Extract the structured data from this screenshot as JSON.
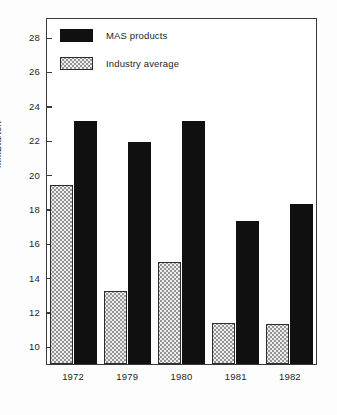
{
  "chart_data": {
    "type": "bar",
    "title": "",
    "subtitle": "",
    "xlabel": "",
    "ylabel": "MMBtu/ton",
    "categories": [
      "1972",
      "1979",
      "1980",
      "1981",
      "1982"
    ],
    "series": [
      {
        "name": "MAS products",
        "values": [
          23.2,
          22.0,
          23.2,
          17.4,
          18.4
        ]
      },
      {
        "name": "Industry average",
        "values": [
          19.45,
          13.3,
          15.0,
          11.45,
          11.4
        ]
      }
    ],
    "ylim": [
      9.0,
      29.2
    ],
    "ytick_values": [
      10,
      12,
      14,
      16,
      18,
      20,
      22,
      24,
      26,
      28
    ],
    "ytick_labels": [
      "10",
      "12",
      "14",
      "16",
      "18",
      "20",
      "22",
      "24",
      "26",
      "28"
    ],
    "grid": false,
    "legend_position": "top-left",
    "colors": {
      "mas_products": "#101010",
      "industry_average": "#eeeeee",
      "axis": "#3a3a3a",
      "text": "#1d1d1d",
      "background": "#ffffff"
    }
  },
  "legend": {
    "items": [
      {
        "label": "MAS products",
        "swatch": "dark-filled-swatch"
      },
      {
        "label": "Industry average",
        "swatch": "stippled-swatch"
      }
    ]
  }
}
